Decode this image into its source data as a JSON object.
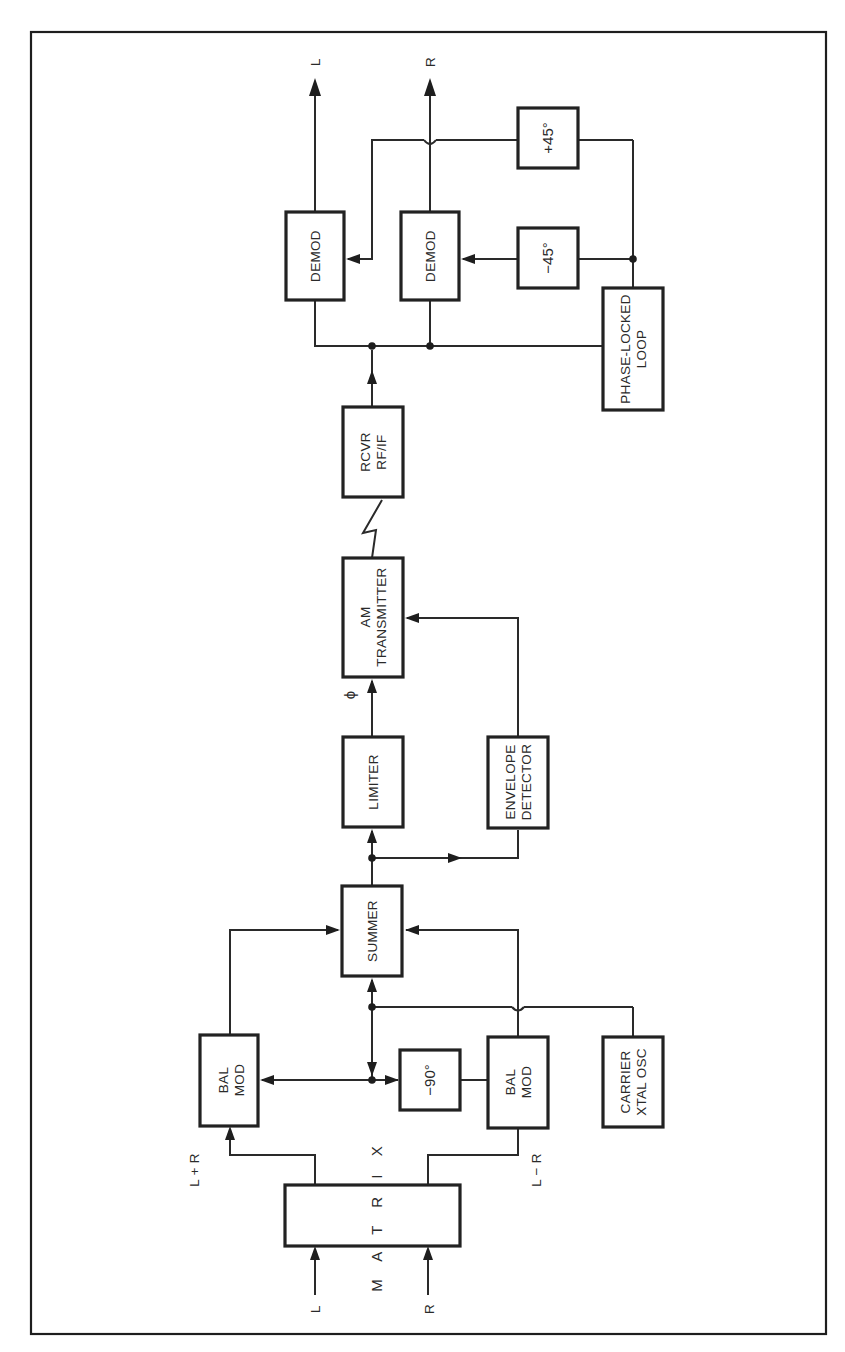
{
  "figure": {
    "type": "block-diagram",
    "orientation": "rotated-90-ccw",
    "colors": {
      "ink": "#222222",
      "background": "#ffffff"
    }
  },
  "blocks": {
    "matrix": {
      "label": "M A T R I X"
    },
    "bal_mod_top": {
      "line1": "BAL",
      "line2": "MOD"
    },
    "bal_mod_bottom": {
      "line1": "BAL",
      "line2": "MOD"
    },
    "phase_minus90": {
      "label": "−90°"
    },
    "carrier_osc": {
      "line1": "CARRIER",
      "line2": "XTAL OSC"
    },
    "summer": {
      "label": "SUMMER"
    },
    "limiter": {
      "label": "LIMITER"
    },
    "envelope_detector": {
      "line1": "ENVELOPE",
      "line2": "DETECTOR"
    },
    "am_transmitter": {
      "line1": "AM",
      "line2": "TRANSMITTER"
    },
    "receiver": {
      "line1": "RCVR",
      "line2": "RF/IF"
    },
    "demod_left": {
      "label": "DEMOD"
    },
    "demod_right": {
      "label": "DEMOD"
    },
    "phase_minus45": {
      "label": "−45°"
    },
    "phase_plus45": {
      "label": "+45°"
    },
    "pll": {
      "line1": "PHASE-LOCKED",
      "line2": "LOOP"
    }
  },
  "signals": {
    "input_left": "L",
    "input_right": "R",
    "sum": "L + R",
    "difference": "L − R",
    "phase": "ϕ",
    "output_left": "L",
    "output_right": "R"
  }
}
